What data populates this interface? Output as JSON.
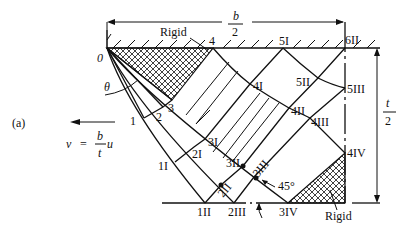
{
  "figure": {
    "panel_label": "(a)",
    "velocity": {
      "lhs": "v",
      "eq": "=",
      "num": "b",
      "den": "t",
      "rhs": "u",
      "direction": "left"
    },
    "dimensions": {
      "width": {
        "num": "b",
        "den": "2"
      },
      "height": {
        "num": "t",
        "den": "2"
      }
    },
    "angle_label": "θ",
    "angle_45": "45°",
    "rigid_labels": [
      "Rigid",
      "Rigid"
    ],
    "origin_label": "0",
    "nodes": {
      "n1": "1",
      "n2": "2",
      "n3": "3",
      "n4": "4",
      "n1I": "1I",
      "n2I": "2I",
      "n3I": "3I",
      "n4I": "4I",
      "n5I": "5I",
      "n1II": "1II",
      "n2II": "2II",
      "n3II": "3II",
      "n4II": "4II",
      "n5II": "5II",
      "n6II": "6II",
      "n2III": "2III",
      "n3III": "3III",
      "n4III": "4III",
      "n5III": "5III",
      "n3IV": "3IV",
      "n4IV": "4IV"
    }
  }
}
